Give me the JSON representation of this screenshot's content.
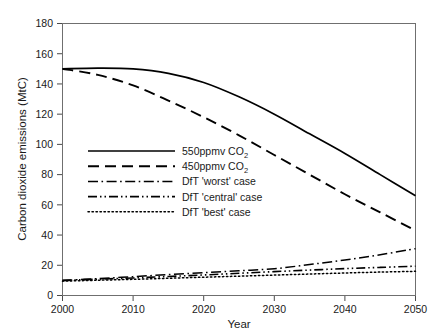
{
  "chart_data": {
    "type": "line",
    "title": "",
    "xlabel": "Year",
    "ylabel": "Carbon dioxide emissions (MtC)",
    "xlim": [
      2000,
      2050
    ],
    "ylim": [
      0,
      180
    ],
    "xticks": [
      2000,
      2010,
      2020,
      2030,
      2040,
      2050
    ],
    "yticks": [
      0,
      20,
      40,
      60,
      80,
      100,
      120,
      140,
      160,
      180
    ],
    "grid": false,
    "legend_position": "center-left",
    "x": [
      2000,
      2005,
      2010,
      2015,
      2020,
      2025,
      2030,
      2035,
      2040,
      2045,
      2050
    ],
    "series": [
      {
        "name": "550ppmv CO2",
        "label": "550ppmv CO",
        "label_sub": "2",
        "style": "solid",
        "values": [
          150,
          150.5,
          150,
          147,
          141,
          131.5,
          120,
          107,
          94,
          80,
          66
        ]
      },
      {
        "name": "450ppmv CO2",
        "label": "450ppmv CO",
        "label_sub": "2",
        "style": "dashed",
        "values": [
          150,
          146,
          139,
          129,
          118,
          106,
          93,
          80,
          67,
          55,
          43
        ]
      },
      {
        "name": "DfT 'worst' case",
        "label": "DfT 'worst' case",
        "label_sub": "",
        "style": "dashdot",
        "values": [
          10,
          11.2,
          12.5,
          13.8,
          15.1,
          16.4,
          17.7,
          20.5,
          23.5,
          27,
          31
        ]
      },
      {
        "name": "DfT 'central' case",
        "label": "DfT 'central' case",
        "label_sub": "",
        "style": "dashdotdot",
        "values": [
          10,
          10.8,
          11.6,
          12.6,
          13.6,
          14.7,
          15.8,
          16.8,
          17.8,
          18.6,
          19.4
        ]
      },
      {
        "name": "DfT 'best' case",
        "label": "DfT  'best' case",
        "label_sub": "",
        "style": "dotted",
        "values": [
          9.5,
          10.1,
          10.7,
          11.4,
          12.1,
          12.8,
          13.5,
          14.2,
          14.9,
          15.5,
          16
        ]
      }
    ]
  },
  "axes": {
    "y_title": "Carbon dioxide emissions (MtC)",
    "x_title": "Year",
    "y_tick_labels": [
      "180",
      "160",
      "140",
      "120",
      "100",
      "80",
      "60",
      "40",
      "20",
      "0"
    ],
    "x_tick_labels": [
      "2000",
      "2010",
      "2020",
      "2030",
      "2040",
      "2050"
    ]
  },
  "legend": {
    "entries": [
      {
        "label": "550ppmv CO",
        "sub": "2",
        "style": "solid"
      },
      {
        "label": "450ppmv CO",
        "sub": "2",
        "style": "dashed"
      },
      {
        "label": "DfT 'worst' case",
        "sub": "",
        "style": "dashdot"
      },
      {
        "label": "DfT 'central' case",
        "sub": "",
        "style": "dashdotdot"
      },
      {
        "label": "DfT  'best' case",
        "sub": "",
        "style": "dotted"
      }
    ]
  },
  "colors": {
    "line": "#000000",
    "frame": "#6f6f6f",
    "text": "#1a1a1a",
    "background": "#ffffff"
  }
}
